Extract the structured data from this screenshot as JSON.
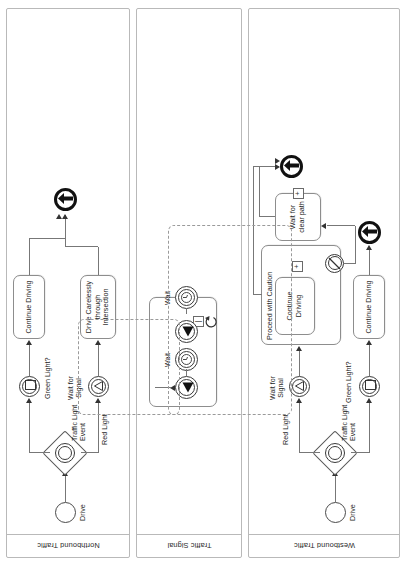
{
  "diagram": {
    "type": "bpmn-collaboration",
    "orientation_note": "rendered rotated 90 degrees in portrait canvas"
  },
  "pools": [
    {
      "id": "northbound",
      "label": "Northbound Traffic",
      "elements": [
        {
          "name": "start-drive",
          "type": "start-event",
          "label": "Drive"
        },
        {
          "name": "traffic-light-event-gateway",
          "type": "event-based-gateway",
          "label": "Traffic Light Event"
        },
        {
          "name": "green-light-event",
          "type": "intermediate-signal-catch",
          "label": "Green Light?"
        },
        {
          "name": "red-light-event",
          "type": "intermediate-signal-catch",
          "label": "Red Light"
        },
        {
          "name": "wait-for-signal-event",
          "type": "intermediate-signal-catch",
          "label": "Wait for Signal"
        },
        {
          "name": "continue-driving-task",
          "type": "task",
          "label": "Continue Driving"
        },
        {
          "name": "drive-carelessly-task",
          "type": "task",
          "label": "Drive Carelessly through Intersection"
        },
        {
          "name": "end-event-north",
          "type": "end-event",
          "label": ""
        }
      ]
    },
    {
      "id": "traffic-signal",
      "label": "Traffic Signal",
      "elements": [
        {
          "name": "wait-timer-1",
          "type": "intermediate-timer",
          "label": "Wait"
        },
        {
          "name": "signal-throw-1",
          "type": "intermediate-signal-throw",
          "label": ""
        },
        {
          "name": "wait-timer-2",
          "type": "intermediate-timer",
          "label": "Wait"
        },
        {
          "name": "signal-throw-2",
          "type": "intermediate-signal-throw",
          "label": ""
        },
        {
          "name": "loop-marker",
          "type": "loop-marker",
          "label": ""
        }
      ]
    },
    {
      "id": "westbound",
      "label": "Westbound Traffic",
      "elements": [
        {
          "name": "start-drive",
          "type": "start-event",
          "label": "Drive"
        },
        {
          "name": "traffic-light-event-gateway",
          "type": "event-based-gateway",
          "label": "Traffic Light Event"
        },
        {
          "name": "green-light-event",
          "type": "intermediate-signal-catch",
          "label": "Green Light?"
        },
        {
          "name": "red-light-event",
          "type": "intermediate-signal-catch",
          "label": "Red Light"
        },
        {
          "name": "wait-for-signal-event",
          "type": "intermediate-signal-catch",
          "label": "Wait for Signal"
        },
        {
          "name": "continue-driving-task",
          "type": "task",
          "label": "Continue Driving"
        },
        {
          "name": "proceed-with-caution-subprocess",
          "type": "sub-process",
          "label": "Proceed with Caution"
        },
        {
          "name": "caution-continue-driving-task",
          "type": "task",
          "label": "Continue Driving"
        },
        {
          "name": "wait-for-clear-path-task",
          "type": "task",
          "label": "Wait for clear path"
        },
        {
          "name": "boundary-event-escalation",
          "type": "non-interrupting-boundary-event",
          "label": ""
        },
        {
          "name": "end-event-west-top",
          "type": "end-event",
          "label": ""
        },
        {
          "name": "end-event-west-lower",
          "type": "end-event",
          "label": ""
        }
      ]
    }
  ],
  "labels": {
    "drive": "Drive",
    "traffic_light_event": "Traffic Light Event",
    "green_light": "Green Light?",
    "red_light": "Red Light",
    "wait_for_signal": "Wait for Signal",
    "continue_driving": "Continue Driving",
    "drive_carelessly": "Drive Carelessly through Intersection",
    "wait": "Wait",
    "proceed_with_caution": "Proceed with Caution",
    "wait_for_clear_path": "Wait for clear path",
    "plus_marker": "+",
    "loop_marker": "↺"
  },
  "colors": {
    "stroke": "#777777",
    "element_stroke": "#8d8d8d",
    "text": "#1d1d1d",
    "background": "#ffffff",
    "group_dash": "#9a9a9a"
  }
}
